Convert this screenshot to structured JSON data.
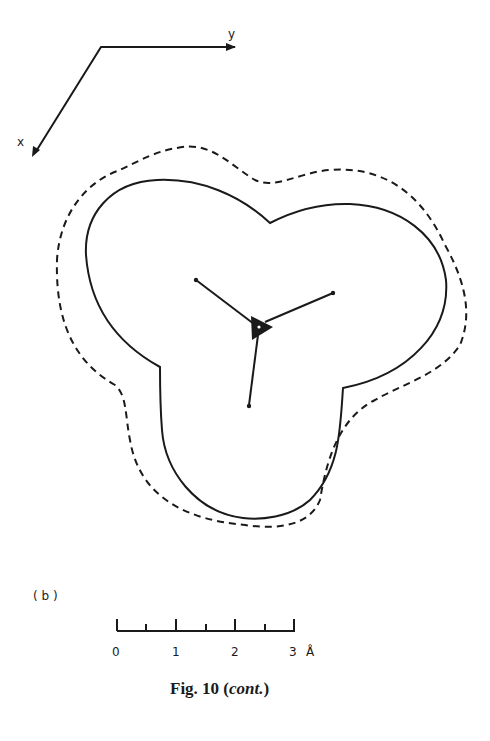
{
  "figure": {
    "panel_label": "( b )",
    "caption_prefix": "Fig. 10 (",
    "caption_italic": "cont.",
    "caption_suffix": ")",
    "axes": {
      "x_label": "x",
      "y_label": "y"
    },
    "scale_bar": {
      "ticks": [
        "0",
        "1",
        "2",
        "3"
      ],
      "unit": "Å",
      "max": 3
    },
    "contours": [
      {
        "name": "inner",
        "style": "solid"
      },
      {
        "name": "outer",
        "style": "dashed"
      }
    ],
    "colors": {
      "ink": "#1a1a1a",
      "background": "#ffffff"
    }
  }
}
